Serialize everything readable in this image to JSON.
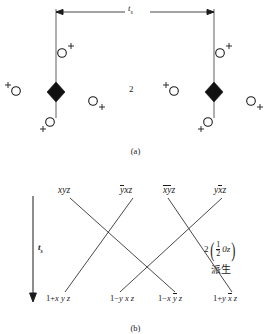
{
  "figure": {
    "panel_a": {
      "caption": "(a)",
      "dimension": {
        "symbol": "t",
        "subscript": "s"
      },
      "center_label": "2",
      "atoms": [
        {
          "id": "a-left-upper",
          "glyph": "O",
          "sign": "+",
          "sign_pos": "super-right"
        },
        {
          "id": "a-left-lower",
          "glyph": "O",
          "sign": "+",
          "sign_pos": "sub-left"
        },
        {
          "id": "a-far-left",
          "glyph": "O",
          "sign": "+",
          "sign_pos": "super-left"
        },
        {
          "id": "a-mid-left",
          "glyph": "O",
          "sign": "+",
          "sign_pos": "sub-right"
        },
        {
          "id": "a-right-upper",
          "glyph": "O",
          "sign": "+",
          "sign_pos": "super-right"
        },
        {
          "id": "a-right-lower",
          "glyph": "O",
          "sign": "+",
          "sign_pos": "sub-left"
        },
        {
          "id": "a-mid-right",
          "glyph": "O",
          "sign": "+",
          "sign_pos": "super-left"
        },
        {
          "id": "a-far-right",
          "glyph": "O",
          "sign": "+",
          "sign_pos": "sub-right"
        }
      ],
      "rotation_points": [
        {
          "id": "twofold-left",
          "symbol": "filled-lozenge"
        },
        {
          "id": "twofold-right",
          "symbol": "filled-lozenge"
        }
      ]
    },
    "panel_b": {
      "caption": "(b)",
      "arrow": {
        "symbol": "t",
        "subscript": "s"
      },
      "top_terms": [
        {
          "id": "t1",
          "parts": [
            {
              "t": "x"
            },
            {
              "t": "y"
            },
            {
              "t": "z"
            }
          ]
        },
        {
          "id": "t2",
          "parts": [
            {
              "t": "y",
              "bar": true
            },
            {
              "t": "x"
            },
            {
              "t": "z"
            }
          ]
        },
        {
          "id": "t3",
          "parts": [
            {
              "t": "x",
              "bar": true
            },
            {
              "t": "y",
              "bar": true
            },
            {
              "t": "z"
            }
          ]
        },
        {
          "id": "t4",
          "parts": [
            {
              "t": "y"
            },
            {
              "t": "x",
              "bar": true
            },
            {
              "t": "z"
            }
          ]
        }
      ],
      "bottom_terms": [
        {
          "id": "b1",
          "lead": "1",
          "op": "+",
          "parts": [
            {
              "t": "x"
            },
            {
              "t": "y"
            },
            {
              "t": "z"
            }
          ]
        },
        {
          "id": "b2",
          "lead": "1",
          "op": "−",
          "parts": [
            {
              "t": "y"
            },
            {
              "t": "x"
            },
            {
              "t": "z"
            }
          ]
        },
        {
          "id": "b3",
          "lead": "1",
          "op": "−",
          "parts": [
            {
              "t": "x"
            },
            {
              "t": "y",
              "bar": true
            },
            {
              "t": "z"
            }
          ]
        },
        {
          "id": "b4",
          "lead": "1",
          "op": "+",
          "parts": [
            {
              "t": "y"
            },
            {
              "t": "x",
              "bar": true
            },
            {
              "t": "z"
            }
          ]
        }
      ],
      "annotation": {
        "coefficient": "2",
        "fraction_numerator": "1",
        "fraction_denominator": "2",
        "tail": "0z",
        "note_cjk": "派生"
      }
    }
  }
}
